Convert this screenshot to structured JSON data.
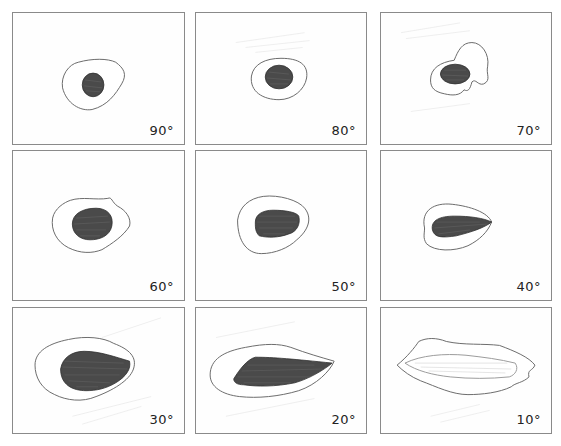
{
  "figure": {
    "panels": [
      {
        "label": "90°",
        "row": 0,
        "col": 0
      },
      {
        "label": "80°",
        "row": 0,
        "col": 1
      },
      {
        "label": "70°",
        "row": 0,
        "col": 2
      },
      {
        "label": "60°",
        "row": 1,
        "col": 0
      },
      {
        "label": "50°",
        "row": 1,
        "col": 1
      },
      {
        "label": "40°",
        "row": 1,
        "col": 2
      },
      {
        "label": "30°",
        "row": 2,
        "col": 0
      },
      {
        "label": "20°",
        "row": 2,
        "col": 1
      },
      {
        "label": "10°",
        "row": 2,
        "col": 2
      }
    ]
  }
}
